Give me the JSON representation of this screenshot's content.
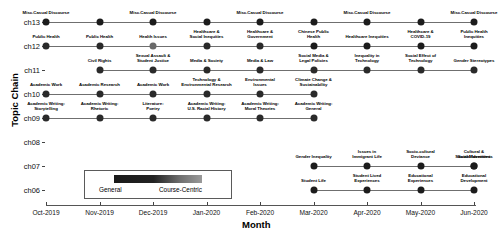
{
  "chart_data": {
    "type": "scatter",
    "title": "",
    "xlabel": "Month",
    "ylabel": "Topic Chain",
    "x_ticks": [
      "Oct-2019",
      "Nov-2019",
      "Dec-2019",
      "Jan-2020",
      "Feb-2020",
      "Mar-2020",
      "Apr-2020",
      "May-2020",
      "Jun-2020"
    ],
    "y_ticks": [
      "ch13",
      "ch12",
      "ch11",
      "ch10",
      "ch09",
      "ch08",
      "ch07",
      "ch06"
    ],
    "grid": false,
    "legend": {
      "position": "inside-bottom-left",
      "type": "colorbar",
      "low_label": "General",
      "high_label": "Course-Centric",
      "low_color": "#1a1a1a",
      "high_color": "#9a9a9a"
    },
    "series": [
      {
        "name": "ch13",
        "label_side": "above",
        "points": [
          {
            "x": "Oct-2019",
            "label": "Misc.Casual Discourse",
            "color": "#1c1c1c"
          },
          {
            "x": "Nov-2019",
            "label": "",
            "color": "#1c1c1c"
          },
          {
            "x": "Dec-2019",
            "label": "Misc.Casual Discourse",
            "color": "#1c1c1c"
          },
          {
            "x": "Jan-2020",
            "label": "",
            "color": "#1c1c1c"
          },
          {
            "x": "Feb-2020",
            "label": "Misc.Casual Discourse",
            "color": "#1c1c1c"
          },
          {
            "x": "Mar-2020",
            "label": "",
            "color": "#1c1c1c"
          },
          {
            "x": "Apr-2020",
            "label": "Misc.Casual Discourse",
            "color": "#1c1c1c"
          },
          {
            "x": "May-2020",
            "label": "",
            "color": "#1c1c1c"
          },
          {
            "x": "Jun-2020",
            "label": "Misc.Casual Discourse",
            "color": "#1c1c1c"
          }
        ]
      },
      {
        "name": "ch12",
        "label_side": "above",
        "points": [
          {
            "x": "Oct-2019",
            "label": "Public Health",
            "color": "#2a2a2a"
          },
          {
            "x": "Nov-2019",
            "label": "Public Health",
            "color": "#2a2a2a"
          },
          {
            "x": "Dec-2019",
            "label": "Health Issues",
            "color": "#6a6a6a"
          },
          {
            "x": "Jan-2020",
            "label": "Healthcare &\nSocial Inequities",
            "color": "#2a2a2a"
          },
          {
            "x": "Feb-2020",
            "label": "Healthcare &\nGovernment",
            "color": "#2a2a2a"
          },
          {
            "x": "Mar-2020",
            "label": "Chinese Public\nHealth",
            "color": "#1c1c1c"
          },
          {
            "x": "Apr-2020",
            "label": "Healthcare Inequities",
            "color": "#1c1c1c"
          },
          {
            "x": "May-2020",
            "label": "Healthcare &\nCOVID-19",
            "color": "#1c1c1c"
          },
          {
            "x": "Jun-2020",
            "label": "Public Health\nInequities",
            "color": "#1c1c1c"
          }
        ]
      },
      {
        "name": "ch11",
        "label_side": "above",
        "points": [
          {
            "x": "Nov-2019",
            "label": "Civil Rights",
            "color": "#2a2a2a"
          },
          {
            "x": "Dec-2019",
            "label": "Sexual Assault &\nStudent Justice",
            "color": "#2a2a2a"
          },
          {
            "x": "Jan-2020",
            "label": "Media & Society",
            "color": "#2a2a2a"
          },
          {
            "x": "Feb-2020",
            "label": "Media & Law",
            "color": "#2a2a2a"
          },
          {
            "x": "Mar-2020",
            "label": "Social Media &\nLegal Policies",
            "color": "#2a2a2a"
          },
          {
            "x": "Apr-2020",
            "label": "Inequality in\nTechnology",
            "color": "#2a2a2a"
          },
          {
            "x": "May-2020",
            "label": "Social Effect of\nTechnology",
            "color": "#2a2a2a"
          },
          {
            "x": "Jun-2020",
            "label": "Gender Stereotypes",
            "color": "#2a2a2a"
          }
        ]
      },
      {
        "name": "ch10",
        "label_side": "above",
        "points": [
          {
            "x": "Oct-2019",
            "label": "Academic Work",
            "color": "#2a2a2a"
          },
          {
            "x": "Nov-2019",
            "label": "Academic Research",
            "color": "#2a2a2a"
          },
          {
            "x": "Dec-2019",
            "label": "Academic Work",
            "color": "#2a2a2a"
          },
          {
            "x": "Jan-2020",
            "label": "Technology &\nEnvironmental Research",
            "color": "#2a2a2a"
          },
          {
            "x": "Feb-2020",
            "label": "Environmental\nIssues",
            "color": "#2a2a2a"
          },
          {
            "x": "Mar-2020",
            "label": "Climate Change &\nSustainability",
            "color": "#2a2a2a"
          }
        ]
      },
      {
        "name": "ch09",
        "label_side": "above",
        "points": [
          {
            "x": "Oct-2019",
            "label": "Academic Writing:\nStorytelling",
            "color": "#2a2a2a"
          },
          {
            "x": "Nov-2019",
            "label": "Academic Writing:\nRhetoric",
            "color": "#2a2a2a"
          },
          {
            "x": "Dec-2019",
            "label": "Literature:\nPoetry",
            "color": "#2a2a2a"
          },
          {
            "x": "Jan-2020",
            "label": "Academic Writing:\nU.S. Racial History",
            "color": "#2a2a2a"
          },
          {
            "x": "Feb-2020",
            "label": "Academic Writing:\nMoral Theories",
            "color": "#2a2a2a"
          },
          {
            "x": "Mar-2020",
            "label": "Academic Writing:\nGeneral",
            "color": "#2a2a2a"
          }
        ]
      },
      {
        "name": "ch08",
        "label_side": "none",
        "points": []
      },
      {
        "name": "ch07",
        "label_side": "above",
        "points": [
          {
            "x": "Mar-2020",
            "label": "Gender Inequality",
            "color": "#1c1c1c"
          },
          {
            "x": "Apr-2020",
            "label": "Issues in\nImmigrant Life",
            "color": "#1c1c1c"
          },
          {
            "x": "May-2020",
            "label": "Socio-cultural\nDeviance",
            "color": "#1c1c1c"
          },
          {
            "x": "Jun-2020",
            "label": "Cultural &\nSocial Identities",
            "color": "#1c1c1c"
          },
          {
            "x": "Jun-2020b",
            "label": "Social Movements",
            "color": "#1c1c1c"
          }
        ]
      },
      {
        "name": "ch06",
        "label_side": "above",
        "points": [
          {
            "x": "Mar-2020",
            "label": "Student Life",
            "color": "#1c1c1c"
          },
          {
            "x": "Apr-2020",
            "label": "Student Lived\nExperiences",
            "color": "#1c1c1c"
          },
          {
            "x": "May-2020",
            "label": "Educational\nExperiences",
            "color": "#1c1c1c"
          },
          {
            "x": "Jun-2020",
            "label": "Educational\nDevelopment",
            "color": "#1c1c1c"
          }
        ]
      }
    ]
  }
}
